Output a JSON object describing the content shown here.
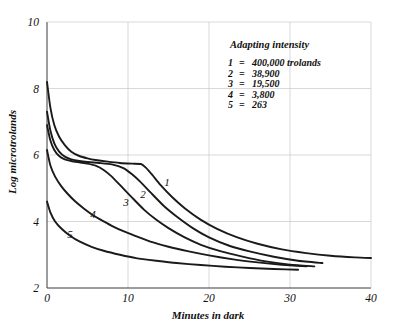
{
  "chart_data": {
    "type": "line",
    "title": "",
    "xlabel": "Minutes in dark",
    "ylabel": "Log microtrolands",
    "xlim": [
      0,
      40
    ],
    "ylim": [
      2,
      10
    ],
    "xticks": [
      "0",
      "10",
      "20",
      "30",
      "40"
    ],
    "yticks": [
      "2",
      "4",
      "6",
      "8",
      "10"
    ],
    "grid": true,
    "legend_position": "upper-right-inside",
    "legend_title": "Adapting intensity",
    "legend_entries": [
      {
        "key": "1",
        "eq": "=",
        "value": "400,000 trolands"
      },
      {
        "key": "2",
        "eq": "=",
        "value": "38,900"
      },
      {
        "key": "3",
        "eq": "=",
        "value": "19,500"
      },
      {
        "key": "4",
        "eq": "=",
        "value": "3,800"
      },
      {
        "key": "5",
        "eq": "=",
        "value": "263"
      }
    ],
    "curve_labels": [
      "1",
      "2",
      "3",
      "4",
      "5"
    ],
    "series": [
      {
        "name": "1",
        "adapting_intensity_trolands": 400000,
        "x": [
          0,
          0.4,
          0.9,
          1.5,
          2.2,
          3.0,
          4.0,
          5.0,
          6.0,
          7.5,
          9.0,
          10.5,
          11.6,
          12.2,
          13.0,
          14.0,
          15.5,
          17.0,
          19.0,
          21.0,
          23.5,
          26.0,
          29.0,
          32.0,
          35.0,
          38.0,
          40.0
        ],
        "y": [
          8.2,
          7.45,
          6.9,
          6.55,
          6.3,
          6.1,
          5.97,
          5.9,
          5.85,
          5.8,
          5.76,
          5.74,
          5.73,
          5.62,
          5.4,
          5.1,
          4.72,
          4.4,
          4.05,
          3.78,
          3.52,
          3.33,
          3.16,
          3.05,
          2.97,
          2.92,
          2.9
        ]
      },
      {
        "name": "2",
        "adapting_intensity_trolands": 38900,
        "x": [
          0,
          0.4,
          0.9,
          1.5,
          2.2,
          3.0,
          4.0,
          5.0,
          6.5,
          8.0,
          9.5,
          10.5,
          11.5,
          13.0,
          14.5,
          16.0,
          18.0,
          20.0,
          22.5,
          25.0,
          28.0,
          31.0,
          34.0
        ],
        "y": [
          7.3,
          6.75,
          6.35,
          6.1,
          5.95,
          5.87,
          5.82,
          5.79,
          5.76,
          5.72,
          5.6,
          5.42,
          5.2,
          4.82,
          4.45,
          4.15,
          3.8,
          3.52,
          3.27,
          3.1,
          2.94,
          2.82,
          2.75
        ]
      },
      {
        "name": "3",
        "adapting_intensity_trolands": 19500,
        "x": [
          0,
          0.4,
          0.9,
          1.5,
          2.2,
          3.0,
          4.0,
          5.0,
          6.0,
          7.0,
          8.0,
          9.0,
          10.5,
          12.0,
          13.5,
          15.0,
          17.0,
          19.0,
          21.5,
          24.0,
          27.0,
          30.0,
          33.0
        ],
        "y": [
          6.9,
          6.45,
          6.15,
          5.97,
          5.87,
          5.82,
          5.78,
          5.74,
          5.68,
          5.55,
          5.35,
          5.1,
          4.72,
          4.35,
          4.05,
          3.8,
          3.52,
          3.3,
          3.1,
          2.95,
          2.8,
          2.7,
          2.65
        ]
      },
      {
        "name": "4",
        "adapting_intensity_trolands": 3800,
        "x": [
          0,
          0.4,
          1.0,
          1.8,
          2.6,
          3.5,
          4.5,
          5.5,
          6.5,
          8.0,
          9.5,
          11.0,
          13.0,
          15.0,
          17.5,
          20.0,
          23.0,
          26.0,
          29.0,
          32.0
        ],
        "y": [
          6.15,
          5.7,
          5.35,
          5.05,
          4.82,
          4.6,
          4.4,
          4.22,
          4.07,
          3.87,
          3.7,
          3.56,
          3.38,
          3.24,
          3.1,
          2.98,
          2.86,
          2.77,
          2.7,
          2.65
        ]
      },
      {
        "name": "5",
        "adapting_intensity_trolands": 263,
        "x": [
          0,
          0.4,
          1.0,
          1.8,
          2.8,
          4.0,
          5.5,
          7.0,
          9.0,
          11.0,
          13.5,
          16.0,
          19.0,
          22.0,
          25.0,
          28.0,
          31.0
        ],
        "y": [
          4.6,
          4.28,
          4.0,
          3.78,
          3.58,
          3.4,
          3.24,
          3.12,
          3.0,
          2.9,
          2.82,
          2.75,
          2.69,
          2.64,
          2.6,
          2.57,
          2.55
        ]
      }
    ]
  },
  "colors": {
    "curve": "#1a1a1a",
    "axis": "#3a3a3a",
    "grid": "#c9c9c9",
    "background": "#ffffff"
  }
}
